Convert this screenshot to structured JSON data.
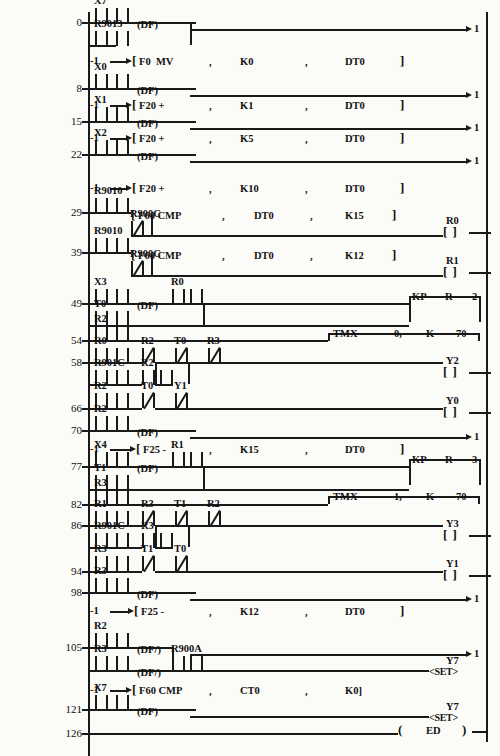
{
  "document": {
    "type": "plc-ladder-logic-diagram",
    "vendor_style": "Panasonic FP-series ladder listing",
    "left_rail_x": 88,
    "right_rail_x": 487,
    "end_label": "ED"
  },
  "rungs": [
    {
      "num": "0",
      "y": 22
    },
    {
      "num": "8",
      "y": 88
    },
    {
      "num": "15",
      "y": 121
    },
    {
      "num": "22",
      "y": 154
    },
    {
      "num": "29",
      "y": 212
    },
    {
      "num": "39",
      "y": 252
    },
    {
      "num": "49",
      "y": 303
    },
    {
      "num": "54",
      "y": 340
    },
    {
      "num": "58",
      "y": 362
    },
    {
      "num": "66",
      "y": 408
    },
    {
      "num": "70",
      "y": 430
    },
    {
      "num": "77",
      "y": 466
    },
    {
      "num": "82",
      "y": 504
    },
    {
      "num": "86",
      "y": 525
    },
    {
      "num": "94",
      "y": 571
    },
    {
      "num": "98",
      "y": 592
    },
    {
      "num": "105",
      "y": 647
    },
    {
      "num": "121",
      "y": 709
    },
    {
      "num": "126",
      "y": 733
    }
  ],
  "contacts": [
    {
      "name": "X7",
      "x": 95,
      "y": 15,
      "type": "no"
    },
    {
      "name": "",
      "x": 116,
      "y": 15,
      "type": "no"
    },
    {
      "name": "R9013",
      "x": 95,
      "y": 38,
      "type": "no"
    },
    {
      "name": "",
      "x": 116,
      "y": 38,
      "type": "no"
    },
    {
      "name": "X0",
      "x": 95,
      "y": 81,
      "type": "no"
    },
    {
      "name": "",
      "x": 116,
      "y": 81,
      "type": "no"
    },
    {
      "name": "X1",
      "x": 95,
      "y": 114,
      "type": "no"
    },
    {
      "name": "",
      "x": 116,
      "y": 114,
      "type": "no"
    },
    {
      "name": "X2",
      "x": 95,
      "y": 147,
      "type": "no"
    },
    {
      "name": "",
      "x": 116,
      "y": 147,
      "type": "no"
    },
    {
      "name": "R9010",
      "x": 95,
      "y": 205,
      "type": "no"
    },
    {
      "name": "",
      "x": 116,
      "y": 205,
      "type": "no"
    },
    {
      "name": "R900C",
      "x": 131,
      "y": 228,
      "type": "nc"
    },
    {
      "name": "R9010",
      "x": 95,
      "y": 245,
      "type": "no"
    },
    {
      "name": "",
      "x": 116,
      "y": 245,
      "type": "no"
    },
    {
      "name": "R900C",
      "x": 131,
      "y": 268,
      "type": "nc"
    },
    {
      "name": "X3",
      "x": 95,
      "y": 296,
      "type": "no"
    },
    {
      "name": "",
      "x": 116,
      "y": 296,
      "type": "no"
    },
    {
      "name": "R0",
      "x": 172,
      "y": 296,
      "type": "no"
    },
    {
      "name": "",
      "x": 190,
      "y": 296,
      "type": "no"
    },
    {
      "name": "T0",
      "x": 95,
      "y": 318,
      "type": "no"
    },
    {
      "name": "",
      "x": 116,
      "y": 318,
      "type": "no"
    },
    {
      "name": "R2",
      "x": 95,
      "y": 333,
      "type": "no"
    },
    {
      "name": "",
      "x": 116,
      "y": 333,
      "type": "no"
    },
    {
      "name": "R0",
      "x": 95,
      "y": 355,
      "type": "no"
    },
    {
      "name": "",
      "x": 116,
      "y": 355,
      "type": "no"
    },
    {
      "name": "R2",
      "x": 142,
      "y": 355,
      "type": "nc"
    },
    {
      "name": "T0",
      "x": 175,
      "y": 355,
      "type": "nc"
    },
    {
      "name": "R3",
      "x": 208,
      "y": 355,
      "type": "nc"
    },
    {
      "name": "R901C",
      "x": 95,
      "y": 377,
      "type": "no"
    },
    {
      "name": "",
      "x": 116,
      "y": 377,
      "type": "no"
    },
    {
      "name": "R2",
      "x": 142,
      "y": 377,
      "type": "no"
    },
    {
      "name": "",
      "x": 160,
      "y": 377,
      "type": "no"
    },
    {
      "name": "R2",
      "x": 95,
      "y": 400,
      "type": "no"
    },
    {
      "name": "",
      "x": 116,
      "y": 400,
      "type": "no"
    },
    {
      "name": "T0",
      "x": 142,
      "y": 400,
      "type": "nc"
    },
    {
      "name": "Y1",
      "x": 175,
      "y": 400,
      "type": "nc"
    },
    {
      "name": "R2",
      "x": 95,
      "y": 423,
      "type": "no"
    },
    {
      "name": "",
      "x": 116,
      "y": 423,
      "type": "no"
    },
    {
      "name": "X4",
      "x": 95,
      "y": 459,
      "type": "no"
    },
    {
      "name": "",
      "x": 116,
      "y": 459,
      "type": "no"
    },
    {
      "name": "R1",
      "x": 172,
      "y": 459,
      "type": "no"
    },
    {
      "name": "",
      "x": 190,
      "y": 459,
      "type": "no"
    },
    {
      "name": "T1",
      "x": 95,
      "y": 482,
      "type": "no"
    },
    {
      "name": "",
      "x": 116,
      "y": 482,
      "type": "no"
    },
    {
      "name": "R3",
      "x": 95,
      "y": 497,
      "type": "no"
    },
    {
      "name": "",
      "x": 116,
      "y": 497,
      "type": "no"
    },
    {
      "name": "R1",
      "x": 95,
      "y": 518,
      "type": "no"
    },
    {
      "name": "",
      "x": 116,
      "y": 518,
      "type": "no"
    },
    {
      "name": "R3",
      "x": 142,
      "y": 518,
      "type": "nc"
    },
    {
      "name": "T1",
      "x": 175,
      "y": 518,
      "type": "nc"
    },
    {
      "name": "R2",
      "x": 208,
      "y": 518,
      "type": "nc"
    },
    {
      "name": "R901C",
      "x": 95,
      "y": 540,
      "type": "no"
    },
    {
      "name": "",
      "x": 116,
      "y": 540,
      "type": "no"
    },
    {
      "name": "R3",
      "x": 142,
      "y": 540,
      "type": "no"
    },
    {
      "name": "",
      "x": 160,
      "y": 540,
      "type": "no"
    },
    {
      "name": "R3",
      "x": 95,
      "y": 563,
      "type": "no"
    },
    {
      "name": "",
      "x": 116,
      "y": 563,
      "type": "no"
    },
    {
      "name": "T1",
      "x": 142,
      "y": 563,
      "type": "nc"
    },
    {
      "name": "T0",
      "x": 175,
      "y": 563,
      "type": "nc"
    },
    {
      "name": "R3",
      "x": 95,
      "y": 585,
      "type": "no"
    },
    {
      "name": "",
      "x": 116,
      "y": 585,
      "type": "no"
    },
    {
      "name": "R2",
      "x": 95,
      "y": 640,
      "type": "no"
    },
    {
      "name": "",
      "x": 116,
      "y": 640,
      "type": "no"
    },
    {
      "name": "R3",
      "x": 95,
      "y": 663,
      "type": "no"
    },
    {
      "name": "",
      "x": 116,
      "y": 663,
      "type": "no"
    },
    {
      "name": "R900A",
      "x": 172,
      "y": 663,
      "type": "no"
    },
    {
      "name": "",
      "x": 190,
      "y": 663,
      "type": "no"
    },
    {
      "name": "X7",
      "x": 95,
      "y": 702,
      "type": "no"
    },
    {
      "name": "",
      "x": 116,
      "y": 702,
      "type": "no"
    }
  ],
  "df_labels": [
    {
      "text": "(DF)",
      "x": 137,
      "y": 25
    },
    {
      "text": "(DF)",
      "x": 137,
      "y": 91
    },
    {
      "text": "(DF)",
      "x": 137,
      "y": 124
    },
    {
      "text": "(DF)",
      "x": 137,
      "y": 157
    },
    {
      "text": "(DF)",
      "x": 137,
      "y": 306
    },
    {
      "text": "(DF)",
      "x": 137,
      "y": 433
    },
    {
      "text": "(DF)",
      "x": 137,
      "y": 469
    },
    {
      "text": "(DF)",
      "x": 137,
      "y": 595
    },
    {
      "text": "(DF/)",
      "x": 137,
      "y": 650
    },
    {
      "text": "(DF/)",
      "x": 137,
      "y": 673
    },
    {
      "text": "(DF)",
      "x": 137,
      "y": 712
    }
  ],
  "function_blocks": [
    {
      "pin": "-1",
      "bracket": "[",
      "text": "F0  MV",
      "a1": "K0",
      "a2": "DT0",
      "close": "]",
      "y": 61,
      "x_arrow": 100,
      "x_br": 132
    },
    {
      "pin": "-1",
      "bracket": "[",
      "text": "F20 +",
      "a1": "K1",
      "a2": "DT0",
      "close": "]",
      "y": 105,
      "x_arrow": 100,
      "x_br": 132
    },
    {
      "pin": "-1",
      "bracket": "[",
      "text": "F20 +",
      "a1": "K5",
      "a2": "DT0",
      "close": "]",
      "y": 138,
      "x_arrow": 100,
      "x_br": 132
    },
    {
      "pin": "-1",
      "bracket": "[",
      "text": "F20 +",
      "a1": "K10",
      "a2": "DT0",
      "close": "]",
      "y": 188,
      "x_arrow": 100,
      "x_br": 132
    },
    {
      "pin": "-1",
      "bracket": "[",
      "text": "F25 -",
      "a1": "K15",
      "a2": "DT0",
      "close": "]",
      "y": 449,
      "x_arrow": 100,
      "x_br": 136
    },
    {
      "pin": "-1",
      "bracket": "[",
      "text": "F25 -",
      "a1": "K12",
      "a2": "DT0",
      "close": "]",
      "y": 611,
      "x_arrow": 100,
      "x_br": 134
    },
    {
      "pin": "-1",
      "bracket": "[",
      "text": "F60 CMP",
      "a1": "CT0",
      "a2": "K0]",
      "close": "",
      "y": 690,
      "x_arrow": 100,
      "x_br": 132
    }
  ],
  "cmp_blocks": [
    {
      "bracket": "[",
      "text": "F60 CMP",
      "a1": "DT0",
      "a2": "K15",
      "close": "]",
      "x": 131,
      "y": 215
    },
    {
      "bracket": "[",
      "text": "F60 CMP",
      "a1": "DT0",
      "a2": "K12",
      "close": "]",
      "x": 131,
      "y": 255
    }
  ],
  "coils": [
    {
      "name": "R0",
      "glyph": "[ ]",
      "x": 443,
      "y": 232,
      "lx": 446,
      "ly": 221
    },
    {
      "name": "R1",
      "glyph": "[ ]",
      "x": 443,
      "y": 272,
      "lx": 446,
      "ly": 261
    },
    {
      "name": "Y2",
      "glyph": "[ ]",
      "x": 443,
      "y": 372,
      "lx": 446,
      "ly": 361
    },
    {
      "name": "Y0",
      "glyph": "[ ]",
      "x": 443,
      "y": 412,
      "lx": 446,
      "ly": 401
    },
    {
      "name": "Y3",
      "glyph": "[ ]",
      "x": 443,
      "y": 535,
      "lx": 446,
      "ly": 524
    },
    {
      "name": "Y1",
      "glyph": "[ ]",
      "x": 443,
      "y": 575,
      "lx": 446,
      "ly": 564
    }
  ],
  "set_outputs": [
    {
      "name": "Y7",
      "glyph": "<SET>",
      "x": 429,
      "y": 672,
      "lx": 446,
      "ly": 661
    },
    {
      "name": "Y7",
      "glyph": "<SET>",
      "x": 429,
      "y": 718,
      "lx": 446,
      "ly": 707
    }
  ],
  "keep_blocks": [
    {
      "op": "KP",
      "operand": "R",
      "num": "2",
      "x": 409,
      "y": 296,
      "w": 70,
      "h": 26
    },
    {
      "op": "KP",
      "operand": "R",
      "num": "3",
      "x": 409,
      "y": 459,
      "w": 70,
      "h": 26
    }
  ],
  "timer_blocks": [
    {
      "op": "TMX",
      "num": "0,",
      "k": "K",
      "preset": "70",
      "x": 328,
      "y": 333,
      "w": 150
    },
    {
      "op": "TMX",
      "num": "1,",
      "k": "K",
      "preset": "70",
      "x": 328,
      "y": 496,
      "w": 150
    }
  ],
  "end_block": {
    "open": "(",
    "label": "ED",
    "close": ")",
    "x": 398,
    "y": 731
  },
  "branch_arrows": [
    {
      "label": "1",
      "y": 29
    },
    {
      "label": "1",
      "y": 95
    },
    {
      "label": "1",
      "y": 128
    },
    {
      "label": "1",
      "y": 161
    },
    {
      "label": "1",
      "y": 437
    },
    {
      "label": "1",
      "y": 599
    },
    {
      "label": "1",
      "y": 654
    }
  ]
}
